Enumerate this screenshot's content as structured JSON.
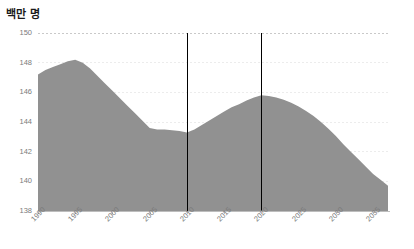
{
  "chart_data": {
    "type": "area",
    "title": "백만 명",
    "xlabel": "",
    "ylabel": "",
    "ylim": [
      138,
      150
    ],
    "xlim": [
      1990,
      2037
    ],
    "grid": true,
    "legend": null,
    "series_name": "인구",
    "fill_color": "#919191",
    "gridline_color": "#ececec",
    "axis_color": "#bdbdbd",
    "marker_line_color": "#000000",
    "y_ticks": [
      150,
      148,
      146,
      144,
      142,
      140,
      138
    ],
    "x_ticks": [
      1990,
      1995,
      2000,
      2005,
      2010,
      2015,
      2020,
      2025,
      2030,
      2035
    ],
    "vertical_markers": [
      2010,
      2020
    ],
    "x": [
      1990,
      1991,
      1992,
      1993,
      1994,
      1995,
      1996,
      1997,
      1998,
      1999,
      2000,
      2001,
      2002,
      2003,
      2004,
      2005,
      2006,
      2007,
      2008,
      2009,
      2010,
      2011,
      2012,
      2013,
      2014,
      2015,
      2016,
      2017,
      2018,
      2019,
      2020,
      2021,
      2022,
      2023,
      2024,
      2025,
      2026,
      2027,
      2028,
      2029,
      2030,
      2031,
      2032,
      2033,
      2034,
      2035,
      2036,
      2037
    ],
    "values": [
      147.2,
      147.5,
      147.7,
      147.9,
      148.1,
      148.2,
      148.0,
      147.6,
      147.1,
      146.6,
      146.1,
      145.6,
      145.1,
      144.6,
      144.1,
      143.6,
      143.5,
      143.5,
      143.45,
      143.4,
      143.3,
      143.5,
      143.8,
      144.1,
      144.4,
      144.7,
      145.0,
      145.2,
      145.45,
      145.65,
      145.8,
      145.75,
      145.65,
      145.5,
      145.3,
      145.05,
      144.75,
      144.4,
      144.0,
      143.55,
      143.05,
      142.5,
      142.0,
      141.5,
      141.0,
      140.5,
      140.1,
      139.7
    ]
  },
  "layout": {
    "plot_left": 38,
    "plot_right": 388,
    "plot_top": 33,
    "plot_bottom": 211
  }
}
